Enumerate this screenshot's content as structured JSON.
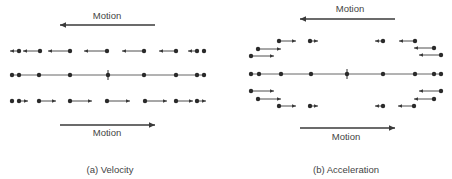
{
  "panels": [
    {
      "id": "a",
      "caption": "(a)  Velocity",
      "top_motion_label": "Motion",
      "bottom_motion_label": "Motion",
      "top_motion_arrow": {
        "x1": 155,
        "x2": 60,
        "y": 25
      },
      "bottom_motion_arrow": {
        "x1": 60,
        "x2": 155,
        "y": 125
      },
      "center_line": {
        "y": 75,
        "x1": 10,
        "x2": 206,
        "tick_x": 108
      },
      "center_dots": [
        12,
        19,
        39,
        70,
        108,
        144,
        176,
        197,
        204
      ],
      "vectors": [
        {
          "x": 19,
          "y": 51,
          "dx": -9
        },
        {
          "x": 40,
          "y": 51,
          "dx": -17
        },
        {
          "x": 70,
          "y": 51,
          "dx": -22
        },
        {
          "x": 107,
          "y": 51,
          "dx": -23
        },
        {
          "x": 144,
          "y": 51,
          "dx": -22
        },
        {
          "x": 176,
          "y": 51,
          "dx": -17
        },
        {
          "x": 197,
          "y": 51,
          "dx": -9
        },
        {
          "x": 204,
          "y": 51,
          "dx": 0
        },
        {
          "x": 12,
          "y": 101,
          "dx": 0
        },
        {
          "x": 19,
          "y": 101,
          "dx": 9
        },
        {
          "x": 39,
          "y": 101,
          "dx": 17
        },
        {
          "x": 70,
          "y": 101,
          "dx": 22
        },
        {
          "x": 107,
          "y": 101,
          "dx": 23
        },
        {
          "x": 145,
          "y": 101,
          "dx": 22
        },
        {
          "x": 176,
          "y": 101,
          "dx": 17
        },
        {
          "x": 197,
          "y": 101,
          "dx": 9
        }
      ]
    },
    {
      "id": "b",
      "caption": "(b)  Acceleration",
      "top_motion_label": "Motion",
      "bottom_motion_label": "Motion",
      "top_motion_arrow": {
        "x1": 395,
        "x2": 300,
        "y": 19
      },
      "bottom_motion_arrow": {
        "x1": 300,
        "x2": 395,
        "y": 128
      },
      "center_line": {
        "y": 74,
        "x1": 249,
        "x2": 443,
        "tick_x": 347
      },
      "center_dots": [
        251,
        259,
        281,
        311,
        347,
        383,
        415,
        434,
        441
      ],
      "vectors": [
        {
          "x": 279,
          "y": 41,
          "dx": 17
        },
        {
          "x": 310,
          "y": 41,
          "dx": 8
        },
        {
          "x": 383,
          "y": 41,
          "dx": -8
        },
        {
          "x": 415,
          "y": 41,
          "dx": -16
        },
        {
          "x": 258,
          "y": 49,
          "dx": 23
        },
        {
          "x": 434,
          "y": 48,
          "dx": -20
        },
        {
          "x": 251,
          "y": 56,
          "dx": 23
        },
        {
          "x": 441,
          "y": 55,
          "dx": -22
        },
        {
          "x": 251,
          "y": 91,
          "dx": 23
        },
        {
          "x": 441,
          "y": 91,
          "dx": -22
        },
        {
          "x": 258,
          "y": 99,
          "dx": 23
        },
        {
          "x": 434,
          "y": 99,
          "dx": -20
        },
        {
          "x": 279,
          "y": 106,
          "dx": 17
        },
        {
          "x": 310,
          "y": 106,
          "dx": 8
        },
        {
          "x": 383,
          "y": 106,
          "dx": -8
        },
        {
          "x": 414,
          "y": 106,
          "dx": -16
        }
      ]
    }
  ],
  "labels": {
    "a_top_motion": "Motion",
    "a_bottom_motion": "Motion",
    "a_caption": "(a)  Velocity",
    "b_top_motion": "Motion",
    "b_bottom_motion": "Motion",
    "b_caption": "(b)  Acceleration"
  },
  "colors": {
    "ink": "#3a3a3a",
    "dot": "#2a2a2a",
    "line": "#555555"
  }
}
